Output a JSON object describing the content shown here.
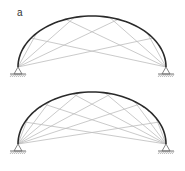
{
  "figure": {
    "panel_label": "a",
    "colors": {
      "arch": "#2a2a2a",
      "cable": "#bdbdbd",
      "support": "#666666",
      "ground_hatch": "#888888"
    },
    "diagrams": [
      {
        "name": "arch-top",
        "left_support": [
          18,
          67
        ],
        "right_support": [
          166,
          67
        ],
        "apex_y": 16,
        "cables_per_support": 4
      },
      {
        "name": "arch-bottom",
        "left_support": [
          18,
          144
        ],
        "right_support": [
          166,
          144
        ],
        "apex_y": 92,
        "cables_per_support": 6
      }
    ]
  }
}
